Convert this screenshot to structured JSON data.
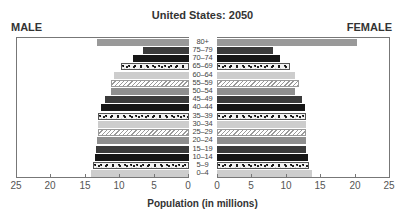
{
  "chart_data": {
    "type": "bar",
    "orientation": "horizontal",
    "subtype": "population-pyramid",
    "title": "United States: 2050",
    "xlabel": "Population (in millions)",
    "ylabel": "",
    "left_label": "MALE",
    "right_label": "FEMALE",
    "categories": [
      "80+",
      "75–79",
      "70–74",
      "65–69",
      "60–64",
      "55–59",
      "50–54",
      "45–49",
      "40–44",
      "35–39",
      "30–34",
      "25–29",
      "20–24",
      "15–19",
      "10–14",
      "5–9",
      "0–4"
    ],
    "series": [
      {
        "name": "MALE",
        "values": [
          13.3,
          6.7,
          8.1,
          9.9,
          10.9,
          11.3,
          11.3,
          12.2,
          12.8,
          13.2,
          13.2,
          13.2,
          13.3,
          13.5,
          13.6,
          13.9,
          14.2
        ]
      },
      {
        "name": "FEMALE",
        "values": [
          20.3,
          8.1,
          9.1,
          10.6,
          11.4,
          11.9,
          11.4,
          12.3,
          12.8,
          13.0,
          12.9,
          12.9,
          13.0,
          13.0,
          13.2,
          13.3,
          13.8
        ]
      }
    ],
    "patterns": [
      "top",
      "dark",
      "black",
      "speckle",
      "light",
      "hatch",
      "medium",
      "dark",
      "black",
      "speckle",
      "light",
      "hatch",
      "medium",
      "dark",
      "black",
      "speckle",
      "light"
    ],
    "xlim": [
      0,
      25
    ],
    "xticks": [
      0,
      5,
      10,
      15,
      20,
      25
    ],
    "xtick_labels_left": [
      "25",
      "20",
      "15",
      "10",
      "5",
      "0"
    ],
    "xtick_labels_right": [
      "0",
      "5",
      "10",
      "15",
      "20",
      "25"
    ],
    "grid": false,
    "legend": "none"
  }
}
